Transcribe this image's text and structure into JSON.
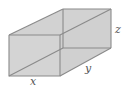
{
  "figure": {
    "type": "rectangular-box",
    "labels": {
      "x": "x",
      "y": "y",
      "z": "z"
    },
    "colors": {
      "fill": "#d4d4d4",
      "edge": "#8a8a8a",
      "text": "#555555"
    }
  }
}
